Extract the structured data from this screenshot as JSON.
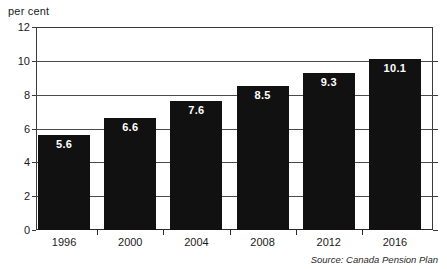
{
  "chart_data": {
    "type": "bar",
    "title": "",
    "subtitle": "",
    "xlabel": "",
    "ylabel": "per cent",
    "categories": [
      "1996",
      "2000",
      "2004",
      "2008",
      "2012",
      "2016"
    ],
    "values": [
      5.6,
      6.6,
      7.6,
      8.5,
      9.3,
      10.1
    ],
    "value_labels": [
      "5.6",
      "6.6",
      "7.6",
      "8.5",
      "9.3",
      "10.1"
    ],
    "ylim": [
      0,
      12
    ],
    "yticks": [
      0,
      2,
      4,
      6,
      8,
      10,
      12
    ],
    "ytick_labels": [
      "0",
      "2",
      "4",
      "6",
      "8",
      "10",
      "12"
    ],
    "grid": true,
    "grid_axis": "y",
    "legend": false,
    "legend_position": "none",
    "series": [
      {
        "name": "per cent",
        "values": [
          5.6,
          6.6,
          7.6,
          8.5,
          9.3,
          10.1
        ]
      }
    ],
    "bar_color": "#111111",
    "bar_label_color": "#ffffff",
    "frame_color": "#3a3a3a",
    "source_note": "Source: Canada Pension Plan"
  }
}
